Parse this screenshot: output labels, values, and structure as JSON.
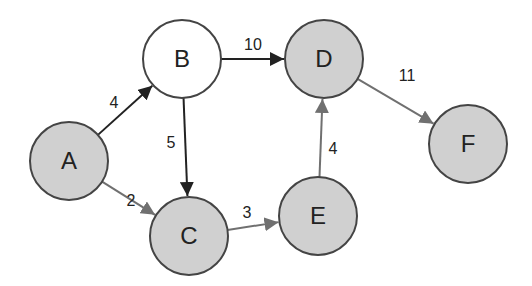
{
  "diagram": {
    "type": "directed-weighted-graph",
    "colors": {
      "shaded_fill": "#d0d0d0",
      "unshaded_fill": "#ffffff",
      "node_stroke": "#444444",
      "dark_edge": "#222222",
      "gray_edge": "#707070"
    },
    "nodes": [
      {
        "id": "A",
        "label": "A",
        "cx": 69,
        "cy": 161,
        "shaded": true
      },
      {
        "id": "B",
        "label": "B",
        "cx": 182,
        "cy": 59,
        "shaded": false
      },
      {
        "id": "C",
        "label": "C",
        "cx": 189,
        "cy": 236,
        "shaded": true
      },
      {
        "id": "D",
        "label": "D",
        "cx": 324,
        "cy": 59,
        "shaded": true
      },
      {
        "id": "E",
        "label": "E",
        "cx": 318,
        "cy": 216,
        "shaded": true
      },
      {
        "id": "F",
        "label": "F",
        "cx": 468,
        "cy": 144,
        "shaded": true
      }
    ],
    "edges": [
      {
        "from": "A",
        "to": "B",
        "weight": "4",
        "style": "dark",
        "label_x": 114,
        "label_y": 108
      },
      {
        "from": "B",
        "to": "D",
        "weight": "10",
        "style": "dark",
        "label_x": 253,
        "label_y": 50
      },
      {
        "from": "B",
        "to": "C",
        "weight": "5",
        "style": "dark",
        "label_x": 171,
        "label_y": 148
      },
      {
        "from": "A",
        "to": "C",
        "weight": "2",
        "style": "gray",
        "label_x": 131,
        "label_y": 206
      },
      {
        "from": "C",
        "to": "E",
        "weight": "3",
        "style": "gray",
        "label_x": 247,
        "label_y": 218
      },
      {
        "from": "E",
        "to": "D",
        "weight": "4",
        "style": "gray",
        "label_x": 333,
        "label_y": 154
      },
      {
        "from": "D",
        "to": "F",
        "weight": "11",
        "style": "gray",
        "label_x": 407,
        "label_y": 81
      }
    ]
  }
}
